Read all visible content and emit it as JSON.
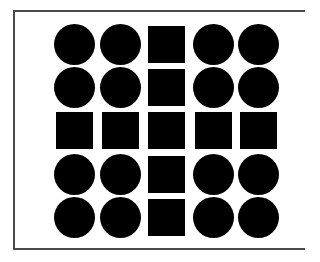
{
  "figure": {
    "colors": {
      "shape": "#000000",
      "frame": "#4a4a4a",
      "background": "#ffffff"
    },
    "grid": {
      "rows": 5,
      "cols": 5,
      "cells": [
        [
          "circle",
          "circle",
          "square",
          "circle",
          "circle"
        ],
        [
          "circle",
          "circle",
          "square",
          "circle",
          "circle"
        ],
        [
          "square",
          "square",
          "square",
          "square",
          "square"
        ],
        [
          "circle",
          "circle",
          "square",
          "circle",
          "circle"
        ],
        [
          "circle",
          "circle",
          "square",
          "circle",
          "circle"
        ]
      ]
    }
  }
}
